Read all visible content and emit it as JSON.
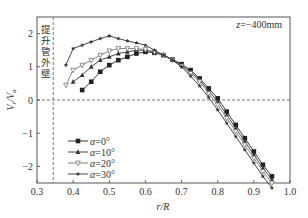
{
  "chart_data": {
    "type": "line",
    "title": "",
    "annotation": "z=−400mm",
    "wall_label": "提升管外壁",
    "xlabel": "r/R",
    "ylabel": "V_r/V_a",
    "xlim": [
      0.3,
      1.0
    ],
    "ylim": [
      -2.5,
      2.5
    ],
    "x_ticks": [
      "0.3",
      "0.4",
      "0.5",
      "0.6",
      "0.7",
      "0.8",
      "0.9",
      "1.0"
    ],
    "y_ticks": [
      "2",
      "1",
      "0",
      "-1",
      "-2"
    ],
    "grid": false,
    "reference_lines": [
      {
        "orientation": "horizontal",
        "value": 0,
        "style": "dashed"
      },
      {
        "orientation": "vertical",
        "value": 0.345,
        "style": "dashed",
        "label": "提升管外壁"
      }
    ],
    "legend_position": "lower-left",
    "series": [
      {
        "name": "α=0°",
        "marker": "square",
        "x": [
          0.425,
          0.45,
          0.475,
          0.5,
          0.525,
          0.55,
          0.575,
          0.6,
          0.625,
          0.65,
          0.675,
          0.7,
          0.725,
          0.75,
          0.775,
          0.8,
          0.825,
          0.85,
          0.875,
          0.9,
          0.925,
          0.95
        ],
        "values": [
          0.3,
          0.55,
          0.85,
          1.05,
          1.2,
          1.3,
          1.4,
          1.45,
          1.42,
          1.35,
          1.22,
          1.08,
          0.9,
          0.65,
          0.35,
          0.05,
          -0.35,
          -0.75,
          -1.15,
          -1.55,
          -1.95,
          -2.3
        ]
      },
      {
        "name": "α=10°",
        "marker": "triangle-up",
        "x": [
          0.4,
          0.425,
          0.45,
          0.475,
          0.5,
          0.525,
          0.55,
          0.575,
          0.6,
          0.625,
          0.65,
          0.675,
          0.7,
          0.725,
          0.75,
          0.775,
          0.8,
          0.825,
          0.85,
          0.875,
          0.9,
          0.925,
          0.95
        ],
        "values": [
          0.55,
          0.75,
          1.0,
          1.2,
          1.3,
          1.4,
          1.45,
          1.5,
          1.5,
          1.45,
          1.35,
          1.2,
          1.05,
          0.85,
          0.6,
          0.28,
          -0.05,
          -0.45,
          -0.85,
          -1.25,
          -1.65,
          -2.05,
          -2.4
        ]
      },
      {
        "name": "α=20°",
        "marker": "triangle-down",
        "x": [
          0.38,
          0.4,
          0.425,
          0.45,
          0.475,
          0.5,
          0.525,
          0.55,
          0.575,
          0.6,
          0.625,
          0.65,
          0.675,
          0.7,
          0.725,
          0.75,
          0.775,
          0.8,
          0.825,
          0.85,
          0.875,
          0.9,
          0.925,
          0.95
        ],
        "values": [
          0.45,
          0.9,
          1.05,
          1.2,
          1.35,
          1.48,
          1.55,
          1.55,
          1.55,
          1.52,
          1.45,
          1.35,
          1.2,
          1.02,
          0.8,
          0.55,
          0.2,
          -0.15,
          -0.55,
          -0.95,
          -1.35,
          -1.75,
          -2.15,
          -2.5
        ]
      },
      {
        "name": "α=30°",
        "marker": "star",
        "x": [
          0.38,
          0.4,
          0.425,
          0.45,
          0.475,
          0.5,
          0.525,
          0.55,
          0.575,
          0.6,
          0.625,
          0.65,
          0.675,
          0.7,
          0.725,
          0.75,
          0.775,
          0.8,
          0.825,
          0.85,
          0.875,
          0.9,
          0.925,
          0.95
        ],
        "values": [
          1.05,
          1.55,
          1.65,
          1.75,
          1.85,
          1.93,
          1.85,
          1.78,
          1.72,
          1.65,
          1.5,
          1.35,
          1.2,
          1.0,
          0.72,
          0.42,
          0.08,
          -0.3,
          -0.7,
          -1.1,
          -1.5,
          -1.9,
          -2.3,
          -2.65
        ]
      }
    ]
  }
}
